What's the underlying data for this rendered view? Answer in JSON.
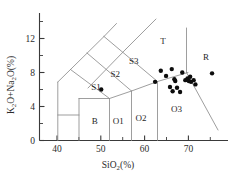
{
  "chart_data": {
    "type": "scatter",
    "title": "",
    "xlabel": "SiO2(%)",
    "ylabel": "K2O+Na2O(%)",
    "xlim": [
      36,
      79
    ],
    "ylim": [
      0,
      15
    ],
    "grid": false,
    "legend": "none",
    "xticks_major": [
      40,
      50,
      60,
      70
    ],
    "xticks_major_labels": [
      "40",
      "50",
      "60",
      "70"
    ],
    "xticks_minor": [
      45,
      55,
      65,
      75
    ],
    "yticks_major": [
      0,
      4,
      8,
      12
    ],
    "yticks_major_labels": [
      "0",
      "4",
      "8",
      "12"
    ],
    "yticks_minor": [
      2,
      6,
      10,
      14
    ],
    "series": [
      {
        "name": "samples",
        "marker": "filled-circle",
        "color": "#0d0d0d",
        "points": [
          {
            "x": 50.1,
            "y": 6.0
          },
          {
            "x": 62.4,
            "y": 6.9
          },
          {
            "x": 63.7,
            "y": 8.2
          },
          {
            "x": 64.9,
            "y": 7.6
          },
          {
            "x": 65.8,
            "y": 6.3
          },
          {
            "x": 66.2,
            "y": 8.4
          },
          {
            "x": 66.4,
            "y": 5.8
          },
          {
            "x": 66.8,
            "y": 7.2
          },
          {
            "x": 67.0,
            "y": 7.0
          },
          {
            "x": 67.4,
            "y": 6.2
          },
          {
            "x": 68.1,
            "y": 5.7
          },
          {
            "x": 68.6,
            "y": 8.0
          },
          {
            "x": 69.3,
            "y": 7.1
          },
          {
            "x": 69.8,
            "y": 7.3
          },
          {
            "x": 70.1,
            "y": 7.0
          },
          {
            "x": 70.4,
            "y": 7.5
          },
          {
            "x": 70.6,
            "y": 6.9
          },
          {
            "x": 71.2,
            "y": 7.1
          },
          {
            "x": 71.6,
            "y": 6.6
          },
          {
            "x": 75.4,
            "y": 7.9
          }
        ]
      }
    ],
    "fields": [
      {
        "name": "B",
        "label": "B",
        "label_x": 48.6,
        "label_y": 1.9
      },
      {
        "name": "O1",
        "label": "O1",
        "label_x": 54.0,
        "label_y": 1.9
      },
      {
        "name": "O2",
        "label": "O2",
        "label_x": 59.2,
        "label_y": 2.3
      },
      {
        "name": "O3",
        "label": "O3",
        "label_x": 67.3,
        "label_y": 3.3
      },
      {
        "name": "S1",
        "label": "S1",
        "label_x": 48.9,
        "label_y": 6.0
      },
      {
        "name": "S2",
        "label": "S2",
        "label_x": 53.3,
        "label_y": 7.5
      },
      {
        "name": "S3",
        "label": "S3",
        "label_x": 57.5,
        "label_y": 9.0
      },
      {
        "name": "T",
        "label": "T",
        "label_x": 64.2,
        "label_y": 11.3
      },
      {
        "name": "R",
        "label": "R",
        "label_x": 74.0,
        "label_y": 9.5
      }
    ]
  },
  "axes": {
    "x_title_main": "SiO",
    "x_title_sub": "2",
    "x_title_tail": "(%)",
    "y_title_p1": "K",
    "y_title_s1": "2",
    "y_title_p2": "O+Na",
    "y_title_s2": "2",
    "y_title_p3": "O(%)"
  },
  "colors": {
    "axis": "#3a3a3a",
    "field_line": "#8d8d8d",
    "point": "#0d0d0d",
    "text": "#2b2b2b",
    "background": "#ffffff"
  }
}
